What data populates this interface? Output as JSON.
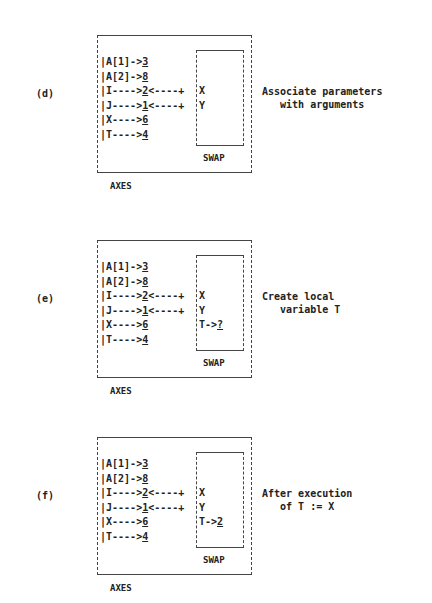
{
  "panels": [
    {
      "label": "(d)",
      "outer_name": "AXES",
      "inner_name": "SWAP",
      "axes_rows": [
        {
          "name": "A[1]->",
          "value": "3",
          "link": ""
        },
        {
          "name": "A[2]->",
          "value": "8",
          "link": ""
        },
        {
          "name": "I---->",
          "value": "2",
          "link": "<----+"
        },
        {
          "name": "J---->",
          "value": "1",
          "link": "<----+"
        },
        {
          "name": "X---->",
          "value": "6",
          "link": ""
        },
        {
          "name": "T---->",
          "value": "4",
          "link": ""
        }
      ],
      "swap_rows": [
        "",
        "",
        "X",
        "Y",
        "",
        ""
      ],
      "swap_local": null,
      "description": [
        "Associate parameters",
        "   with arguments"
      ]
    },
    {
      "label": "(e)",
      "outer_name": "AXES",
      "inner_name": "SWAP",
      "axes_rows": [
        {
          "name": "A[1]->",
          "value": "3",
          "link": ""
        },
        {
          "name": "A[2]->",
          "value": "8",
          "link": ""
        },
        {
          "name": "I---->",
          "value": "2",
          "link": "<----+"
        },
        {
          "name": "J---->",
          "value": "1",
          "link": "<----+"
        },
        {
          "name": "X---->",
          "value": "6",
          "link": ""
        },
        {
          "name": "T---->",
          "value": "4",
          "link": ""
        }
      ],
      "swap_rows": [
        "",
        "",
        "X",
        "Y",
        "",
        ""
      ],
      "swap_local": {
        "name": "T->",
        "value": "?"
      },
      "description": [
        "Create local",
        "   variable T"
      ]
    },
    {
      "label": "(f)",
      "outer_name": "AXES",
      "inner_name": "SWAP",
      "axes_rows": [
        {
          "name": "A[1]->",
          "value": "3",
          "link": ""
        },
        {
          "name": "A[2]->",
          "value": "8",
          "link": ""
        },
        {
          "name": "I---->",
          "value": "2",
          "link": "<----+"
        },
        {
          "name": "J---->",
          "value": "1",
          "link": "<----+"
        },
        {
          "name": "X---->",
          "value": "6",
          "link": ""
        },
        {
          "name": "T---->",
          "value": "4",
          "link": ""
        }
      ],
      "swap_rows": [
        "",
        "",
        "X",
        "Y",
        "",
        ""
      ],
      "swap_local": {
        "name": "T->",
        "value": "2"
      },
      "description": [
        "After execution",
        "   of T := X"
      ]
    }
  ]
}
